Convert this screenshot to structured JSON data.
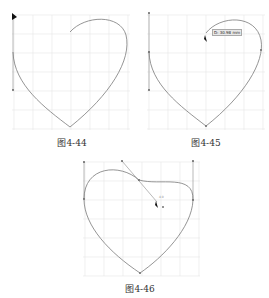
{
  "figures": [
    {
      "id": "fig-4-44",
      "caption": "图4-44"
    },
    {
      "id": "fig-4-45",
      "caption": "图4-45",
      "tooltip": "D: 30.98 mm"
    },
    {
      "id": "fig-4-46",
      "caption": "图4-46",
      "marker_label": "4.0"
    }
  ],
  "colors": {
    "grid": "#e6e6e6",
    "curve": "#7a7a7a",
    "handle": "#8a8a8a",
    "cursor": "#111111"
  }
}
